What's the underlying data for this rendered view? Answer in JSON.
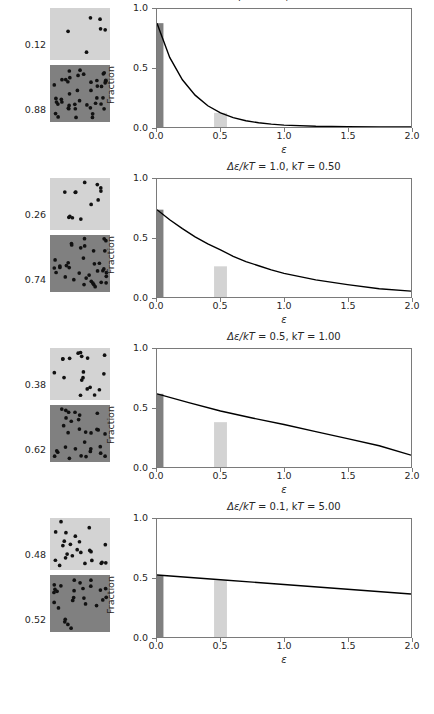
{
  "figure": {
    "axis": {
      "xlabel": "ε",
      "ylabel": "Fraction",
      "xticks": [
        "0.0",
        "0.5",
        "1.0",
        "1.5",
        "2.0"
      ],
      "yticks": [
        "0.0",
        "0.5",
        "1.0"
      ],
      "xlim": [
        0.0,
        2.0
      ],
      "ylim": [
        0.0,
        1.0
      ]
    },
    "colors": {
      "dark_state": "#808080",
      "light_state": "#d3d3d3",
      "curve": "#000000",
      "axis": "#7a7a7a",
      "text": "#262626"
    }
  },
  "panels": [
    {
      "title_prefix": "Δε/kT",
      "title": "Δε/kT = 2.0, kT = 0.25",
      "delta_eps_over_kT": "2.0",
      "kT": "0.25",
      "upper_fraction": "0.12",
      "lower_fraction": "0.88",
      "upper_count": 6,
      "lower_count": 44,
      "bars": [
        {
          "x": 0.0,
          "height": 0.88,
          "state": "ground"
        },
        {
          "x": 0.5,
          "height": 0.12,
          "state": "excited"
        }
      ]
    },
    {
      "title_prefix": "Δε/kT",
      "title": "Δε/kT = 1.0, kT = 0.50",
      "delta_eps_over_kT": "1.0",
      "kT": "0.50",
      "upper_fraction": "0.26",
      "lower_fraction": "0.74",
      "upper_count": 13,
      "lower_count": 37,
      "bars": [
        {
          "x": 0.0,
          "height": 0.74,
          "state": "ground"
        },
        {
          "x": 0.5,
          "height": 0.26,
          "state": "excited"
        }
      ]
    },
    {
      "title_prefix": "Δε/kT",
      "title": "Δε/kT = 0.5, kT = 1.00",
      "delta_eps_over_kT": "0.5",
      "kT": "1.00",
      "upper_fraction": "0.38",
      "lower_fraction": "0.62",
      "upper_count": 19,
      "lower_count": 31,
      "bars": [
        {
          "x": 0.0,
          "height": 0.62,
          "state": "ground"
        },
        {
          "x": 0.5,
          "height": 0.38,
          "state": "excited"
        }
      ]
    },
    {
      "title_prefix": "Δε/kT",
      "title": "Δε/kT = 0.1, kT = 5.00",
      "delta_eps_over_kT": "0.1",
      "kT": "5.00",
      "upper_fraction": "0.48",
      "lower_fraction": "0.52",
      "upper_count": 24,
      "lower_count": 26,
      "bars": [
        {
          "x": 0.0,
          "height": 0.52,
          "state": "ground"
        },
        {
          "x": 0.5,
          "height": 0.48,
          "state": "excited"
        }
      ]
    }
  ],
  "chart_data": {
    "type": "bar",
    "xlabel": "ε",
    "ylabel": "Fraction",
    "xlim": [
      0.0,
      2.0
    ],
    "ylim": [
      0.0,
      1.0
    ],
    "grid": false,
    "legend": null,
    "subplots": [
      {
        "title": "Δε/kT = 2.0, kT = 0.25",
        "kT": 0.25,
        "categories": [
          0.0,
          0.5
        ],
        "values": [
          0.88,
          0.12
        ],
        "bar_colors": [
          "#808080",
          "#d3d3d3"
        ],
        "curve": {
          "type": "line",
          "label": "exp(-ε/kT)/kT normalized",
          "x": [
            0.0,
            0.1,
            0.2,
            0.3,
            0.4,
            0.5,
            0.6,
            0.7,
            0.8,
            0.9,
            1.0,
            1.25,
            1.5,
            1.75,
            2.0
          ],
          "y": [
            0.88,
            0.59,
            0.4,
            0.27,
            0.18,
            0.12,
            0.08,
            0.053,
            0.036,
            0.024,
            0.016,
            0.006,
            0.002,
            0.001,
            0.0
          ]
        }
      },
      {
        "title": "Δε/kT = 1.0, kT = 0.50",
        "kT": 0.5,
        "categories": [
          0.0,
          0.5
        ],
        "values": [
          0.74,
          0.26
        ],
        "bar_colors": [
          "#808080",
          "#d3d3d3"
        ],
        "curve": {
          "type": "line",
          "label": "exp(-ε/kT)/kT normalized",
          "x": [
            0.0,
            0.1,
            0.2,
            0.3,
            0.4,
            0.5,
            0.6,
            0.7,
            0.8,
            0.9,
            1.0,
            1.25,
            1.5,
            1.75,
            2.0
          ],
          "y": [
            0.74,
            0.655,
            0.58,
            0.51,
            0.45,
            0.4,
            0.345,
            0.3,
            0.265,
            0.23,
            0.2,
            0.145,
            0.105,
            0.07,
            0.05
          ]
        }
      },
      {
        "title": "Δε/kT = 0.5, kT = 1.00",
        "kT": 1.0,
        "categories": [
          0.0,
          0.5
        ],
        "values": [
          0.62,
          0.38
        ],
        "bar_colors": [
          "#808080",
          "#d3d3d3"
        ],
        "curve": {
          "type": "line",
          "label": "exp(-ε/kT)/kT normalized",
          "x": [
            0.0,
            0.25,
            0.5,
            0.75,
            1.0,
            1.25,
            1.5,
            1.75,
            2.0
          ],
          "y": [
            0.62,
            0.545,
            0.475,
            0.415,
            0.36,
            0.3,
            0.24,
            0.18,
            0.1
          ]
        }
      },
      {
        "title": "Δε/kT = 0.1, kT = 5.00",
        "kT": 5.0,
        "categories": [
          0.0,
          0.5
        ],
        "values": [
          0.52,
          0.48
        ],
        "bar_colors": [
          "#808080",
          "#d3d3d3"
        ],
        "curve": {
          "type": "line",
          "label": "exp(-ε/kT)/kT normalized",
          "x": [
            0.0,
            0.5,
            1.0,
            1.5,
            2.0
          ],
          "y": [
            0.525,
            0.485,
            0.445,
            0.405,
            0.365
          ]
        }
      }
    ]
  }
}
